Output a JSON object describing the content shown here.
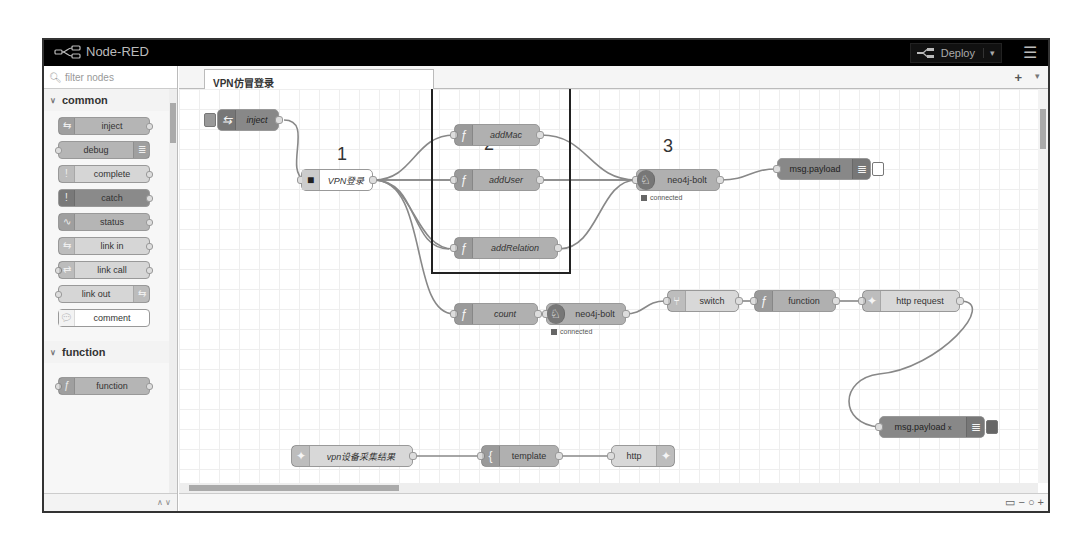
{
  "header": {
    "app_title": "Node-RED",
    "deploy_label": "Deploy",
    "deploy_caret": "▾",
    "menu_icon": "☰"
  },
  "palette": {
    "filter_placeholder": "filter nodes",
    "categories": [
      {
        "name": "common",
        "nodes": [
          {
            "label": "inject"
          },
          {
            "label": "debug"
          },
          {
            "label": "complete"
          },
          {
            "label": "catch"
          },
          {
            "label": "status"
          },
          {
            "label": "link in"
          },
          {
            "label": "link call"
          },
          {
            "label": "link out"
          },
          {
            "label": "comment"
          }
        ]
      },
      {
        "name": "function",
        "nodes": [
          {
            "label": "function"
          }
        ]
      }
    ],
    "footer_controls": "∧ ∨"
  },
  "workspace": {
    "tabs": [
      {
        "label": "VPN仿冒登录",
        "active": true
      }
    ],
    "add_tab": "+",
    "tab_menu": "▾",
    "annotations": {
      "one": "1",
      "two": "2",
      "three": "3"
    },
    "nodes": {
      "inject": {
        "label": "inject"
      },
      "vpn_login": {
        "label": "VPN登录"
      },
      "add_mac": {
        "label": "addMac"
      },
      "add_user": {
        "label": "addUser"
      },
      "add_relation": {
        "label": "addRelation"
      },
      "neo4j_1": {
        "label": "neo4j-bolt",
        "status": "connected"
      },
      "debug_1": {
        "label": "msg.payload"
      },
      "count": {
        "label": "count"
      },
      "neo4j_2": {
        "label": "neo4j-bolt",
        "status": "connected"
      },
      "switch": {
        "label": "switch"
      },
      "function": {
        "label": "function"
      },
      "http_request": {
        "label": "http request"
      },
      "debug_2": {
        "label": "msg.payload"
      },
      "debug_2_x": "x",
      "http_in": {
        "label": "vpn设备采集结果"
      },
      "template": {
        "label": "template"
      },
      "http_out": {
        "label": "http"
      }
    },
    "zoom_controls": {
      "map": "▭",
      "zoom_out": "−",
      "reset": "○",
      "zoom_in": "+"
    }
  }
}
